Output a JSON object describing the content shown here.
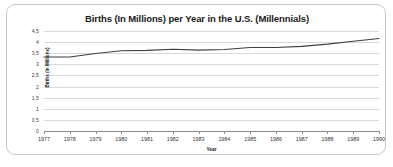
{
  "chart_data": {
    "type": "line",
    "title": "Births (In Millions) per Year in the U.S. (Millennials)",
    "xlabel": "Year",
    "ylabel": "Births (In Millions)",
    "categories": [
      "1977",
      "1978",
      "1979",
      "1980",
      "1981",
      "1982",
      "1983",
      "1984",
      "1985",
      "1986",
      "1987",
      "1988",
      "1989",
      "1990"
    ],
    "values": [
      3.33,
      3.33,
      3.49,
      3.61,
      3.63,
      3.68,
      3.64,
      3.67,
      3.76,
      3.76,
      3.81,
      3.91,
      4.04,
      4.16
    ],
    "ylim": [
      0,
      4.5
    ],
    "ytick_labels": [
      "4,5",
      "4",
      "3,5",
      "3",
      "2,5",
      "2",
      "1,5",
      "1",
      "0,5",
      "0"
    ],
    "ytick_values": [
      4.5,
      4,
      3.5,
      3,
      2.5,
      2,
      1.5,
      1,
      0.5,
      0
    ],
    "grid": true,
    "legend": false,
    "line_color": "#3f3f3f",
    "grid_color": "#d9d9d9"
  }
}
